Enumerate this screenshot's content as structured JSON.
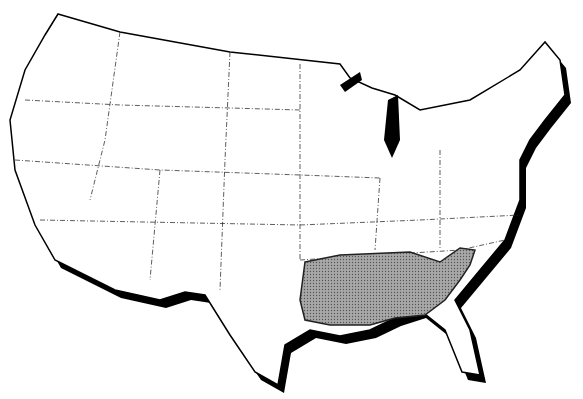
{
  "map": {
    "title": "",
    "region": "Contiguous United States",
    "shaded_region": {
      "description": "Southeastern range area",
      "fill": "#9a9a9a"
    },
    "colors": {
      "land": "#ffffff",
      "border": "#000000",
      "shadow": "#000000",
      "shade": "#9a9a9a"
    }
  }
}
